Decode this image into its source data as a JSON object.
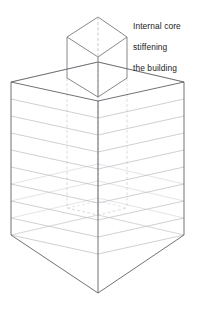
{
  "diagram": {
    "title_visible": false,
    "annotation": {
      "lines": [
        "Internal core",
        "stiffening",
        "the building"
      ],
      "full_text": "Internal core stiffening the building"
    },
    "colors": {
      "background": "#ffffff",
      "outline": "#5a5a60",
      "floor_line": "#b9b9bd",
      "hidden_line": "#d2d2d6",
      "core_outline": "#6a6a70",
      "text": "#1a1a1a"
    },
    "geometry": {
      "building": {
        "center_x": 98,
        "left_x": 11,
        "right_x": 184,
        "roof_back_vertex_y": 62,
        "roof_side_y": 82,
        "roof_front_vertex_y": 101,
        "base_side_y": 235,
        "base_front_vertex_y": 293,
        "floor_count": 9,
        "floor_spacing": 17
      },
      "core": {
        "center_x": 98,
        "left_x": 67,
        "right_x": 127,
        "top_back_vertex_y": 17,
        "top_side_y": 37,
        "top_front_vertex_y": 57,
        "base_side_y": 78,
        "base_front_vertex_y": 97
      }
    }
  }
}
